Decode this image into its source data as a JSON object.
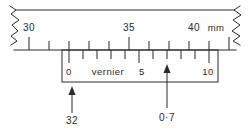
{
  "figure": {
    "kind": "vernier-caliper-scale-diagram",
    "ink_color": "#2b2b2b",
    "background": "#fefefe"
  },
  "main_scale": {
    "name": "main-scale",
    "unit_label": "mm",
    "labels": [
      {
        "text": "30",
        "value": 30
      },
      {
        "text": "35",
        "value": 35
      },
      {
        "text": "40",
        "value": 40
      }
    ],
    "tick_values": [
      30,
      31,
      32,
      33,
      34,
      35,
      36,
      37,
      38,
      39,
      40
    ],
    "range": [
      29.3,
      40.7
    ],
    "broken_left": true,
    "broken_right": true
  },
  "vernier_scale": {
    "name": "vernier-scale",
    "title": "vernier",
    "labels": [
      {
        "text": "0",
        "value": 0
      },
      {
        "text": "5",
        "value": 5
      },
      {
        "text": "10",
        "value": 10
      }
    ],
    "tick_values": [
      0,
      1,
      2,
      3,
      4,
      5,
      6,
      7,
      8,
      9,
      10
    ],
    "zero_aligns_at_mm": 32,
    "coinciding_division": 7
  },
  "callouts": [
    {
      "id": "main-reading",
      "text": "32",
      "points_to": "vernier-zero-mark",
      "meaning": "main scale reading in mm"
    },
    {
      "id": "vernier-reading",
      "text": "0·7",
      "points_to": "vernier-division-7",
      "meaning": "vernier fraction in mm"
    }
  ]
}
